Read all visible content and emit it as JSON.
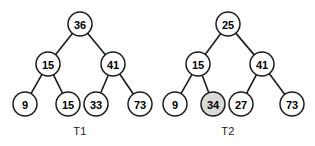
{
  "figure": {
    "background_color": "#ffffff",
    "node_stroke_color": "#1a1a1a",
    "node_fill_color": "#ffffff",
    "node_highlight_fill_color": "#d9d9d9",
    "edge_color": "#1a1a1a",
    "label_color": "#000000",
    "node_radius": 12
  },
  "trees": [
    {
      "id": "t1",
      "caption": "T1",
      "caption_x": 80,
      "caption_y": 131,
      "nodes": [
        {
          "id": "t1-root",
          "label": "36",
          "x": 80,
          "y": 24,
          "highlighted": false
        },
        {
          "id": "t1-n15",
          "label": "15",
          "x": 48,
          "y": 64,
          "highlighted": false
        },
        {
          "id": "t1-n41",
          "label": "41",
          "x": 113,
          "y": 64,
          "highlighted": false
        },
        {
          "id": "t1-n9",
          "label": "9",
          "x": 25,
          "y": 104,
          "highlighted": false
        },
        {
          "id": "t1-n15b",
          "label": "15",
          "x": 68,
          "y": 104,
          "highlighted": false
        },
        {
          "id": "t1-n33",
          "label": "33",
          "x": 96,
          "y": 104,
          "highlighted": false
        },
        {
          "id": "t1-n73",
          "label": "73",
          "x": 140,
          "y": 104,
          "highlighted": false
        }
      ],
      "edges": [
        {
          "from": "t1-root",
          "to": "t1-n15"
        },
        {
          "from": "t1-root",
          "to": "t1-n41"
        },
        {
          "from": "t1-n15",
          "to": "t1-n9"
        },
        {
          "from": "t1-n15",
          "to": "t1-n15b"
        },
        {
          "from": "t1-n41",
          "to": "t1-n33"
        },
        {
          "from": "t1-n41",
          "to": "t1-n73"
        }
      ]
    },
    {
      "id": "t2",
      "caption": "T2",
      "caption_x": 228,
      "caption_y": 131,
      "nodes": [
        {
          "id": "t2-root",
          "label": "25",
          "x": 228,
          "y": 24,
          "highlighted": false
        },
        {
          "id": "t2-n15",
          "label": "15",
          "x": 198,
          "y": 64,
          "highlighted": false
        },
        {
          "id": "t2-n41",
          "label": "41",
          "x": 262,
          "y": 64,
          "highlighted": false
        },
        {
          "id": "t2-n9",
          "label": "9",
          "x": 175,
          "y": 104,
          "highlighted": false
        },
        {
          "id": "t2-n34",
          "label": "34",
          "x": 213,
          "y": 104,
          "highlighted": true
        },
        {
          "id": "t2-n27",
          "label": "27",
          "x": 241,
          "y": 104,
          "highlighted": false
        },
        {
          "id": "t2-n73",
          "label": "73",
          "x": 292,
          "y": 104,
          "highlighted": false
        }
      ],
      "edges": [
        {
          "from": "t2-root",
          "to": "t2-n15"
        },
        {
          "from": "t2-root",
          "to": "t2-n41"
        },
        {
          "from": "t2-n15",
          "to": "t2-n9"
        },
        {
          "from": "t2-n15",
          "to": "t2-n34"
        },
        {
          "from": "t2-n41",
          "to": "t2-n27"
        },
        {
          "from": "t2-n41",
          "to": "t2-n73"
        }
      ]
    }
  ]
}
